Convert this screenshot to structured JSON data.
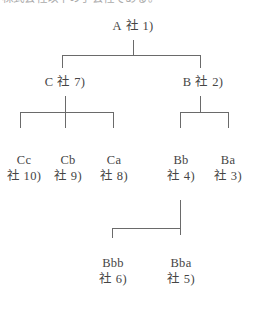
{
  "header": {
    "clipped_text": "株式会社以下の子会社である。"
  },
  "diagram": {
    "type": "hierarchy-tree",
    "line_color": "#6a6a6a",
    "text_color": "#454545",
    "background": "#ffffff",
    "nodes": [
      {
        "id": "A",
        "name": "A",
        "ref": "社 1)",
        "level": 1,
        "x": 133,
        "y": 25
      },
      {
        "id": "C",
        "name": "C",
        "ref": "社 7)",
        "level": 2,
        "x": 65,
        "y": 81
      },
      {
        "id": "B",
        "name": "B",
        "ref": "社 2)",
        "level": 2,
        "x": 203,
        "y": 81
      },
      {
        "id": "Cc",
        "name": "Cc",
        "ref": "社 10)",
        "level": 3,
        "x": 20,
        "y": 160
      },
      {
        "id": "Cb",
        "name": "Cb",
        "ref": "社 9)",
        "level": 3,
        "x": 65,
        "y": 160
      },
      {
        "id": "Ca",
        "name": "Ca",
        "ref": "社 8)",
        "level": 3,
        "x": 113,
        "y": 160
      },
      {
        "id": "Bb",
        "name": "Bb",
        "ref": "社 4)",
        "level": 3,
        "x": 180,
        "y": 160
      },
      {
        "id": "Ba",
        "name": "Ba",
        "ref": "社 3)",
        "level": 3,
        "x": 228,
        "y": 160
      },
      {
        "id": "Bbb",
        "name": "Bbb",
        "ref": "社 6)",
        "level": 4,
        "x": 112,
        "y": 263
      },
      {
        "id": "Bba",
        "name": "Bba",
        "ref": "社 5)",
        "level": 4,
        "x": 180,
        "y": 263
      }
    ],
    "edges": [
      {
        "parent": "A",
        "children": [
          "C",
          "B"
        ]
      },
      {
        "parent": "C",
        "children": [
          "Cc",
          "Cb",
          "Ca"
        ]
      },
      {
        "parent": "B",
        "children": [
          "Bb",
          "Ba"
        ]
      },
      {
        "parent": "Bb",
        "children": [
          "Bbb",
          "Bba"
        ]
      }
    ]
  }
}
